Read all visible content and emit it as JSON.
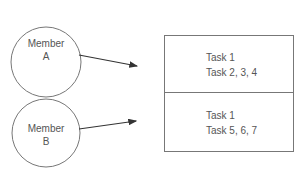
{
  "members": [
    {
      "name_line1": "Member",
      "name_line2": "A"
    },
    {
      "name_line1": "Member",
      "name_line2": "B"
    }
  ],
  "task_box": {
    "sections": [
      {
        "lines": [
          "Task 1",
          "Task 2, 3, 4"
        ]
      },
      {
        "lines": [
          "Task 1",
          "Task 5, 6, 7"
        ]
      }
    ]
  },
  "colors": {
    "stroke": "#666666",
    "text": "#555555"
  }
}
